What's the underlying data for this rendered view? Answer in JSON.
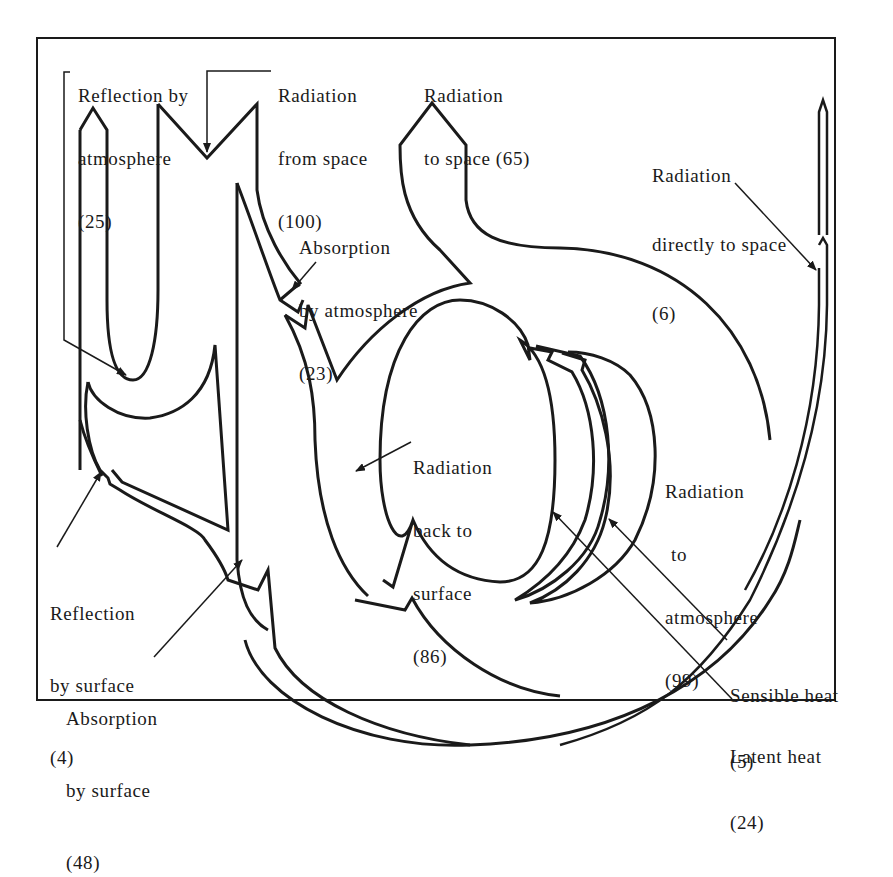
{
  "diagram": {
    "type": "energy-flow",
    "colors": {
      "stroke": "#1a1a1a",
      "background": "#ffffff"
    },
    "labels": {
      "reflection_atmosphere": {
        "line1": "Reflection by",
        "line2": "atmosphere",
        "value": "(25)"
      },
      "radiation_from_space": {
        "line1": "Radiation",
        "line2": "from space",
        "value": "(100)"
      },
      "radiation_to_space": {
        "line1": "Radiation",
        "line2": "to space (65)"
      },
      "radiation_direct_space": {
        "line1": "Radiation",
        "line2": "directly to space",
        "value": "(6)"
      },
      "absorption_atmosphere": {
        "line1": "Absorption",
        "line2": "by atmosphere",
        "value": "(23)"
      },
      "radiation_back_surface": {
        "line1": "Radiation",
        "line2": "back to",
        "line3": "surface",
        "value": "(86)"
      },
      "radiation_to_atmosphere": {
        "line1": "Radiation",
        "line2": "to",
        "line3": "atmosphere",
        "value": "(99)"
      },
      "reflection_surface": {
        "line1": "Reflection",
        "line2": "by surface",
        "value": "(4)"
      },
      "absorption_surface": {
        "line1": "Absorption",
        "line2": "by surface",
        "value": "(48)"
      },
      "sensible_heat": {
        "line1": "Sensible heat",
        "value": "(5)"
      },
      "latent_heat": {
        "line1": "Latent heat",
        "value": "(24)"
      }
    },
    "flows": [
      {
        "name": "Radiation from space",
        "value": 100
      },
      {
        "name": "Reflection by atmosphere",
        "value": 25
      },
      {
        "name": "Absorption by atmosphere",
        "value": 23
      },
      {
        "name": "Reflection by surface",
        "value": 4
      },
      {
        "name": "Absorption by surface",
        "value": 48
      },
      {
        "name": "Radiation to space",
        "value": 65
      },
      {
        "name": "Radiation directly to space",
        "value": 6
      },
      {
        "name": "Radiation back to surface",
        "value": 86
      },
      {
        "name": "Radiation to atmosphere",
        "value": 99
      },
      {
        "name": "Sensible heat",
        "value": 5
      },
      {
        "name": "Latent heat",
        "value": 24
      }
    ]
  }
}
